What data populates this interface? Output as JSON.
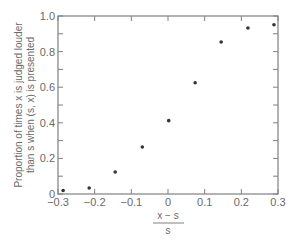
{
  "chart_data": {
    "type": "scatter",
    "title": "",
    "xlabel": {
      "numerator": "x − s",
      "denominator": "s"
    },
    "ylabel": [
      "Proportion of times x is judged louder",
      "than s when (s, x) is presented"
    ],
    "xlim": [
      -0.3,
      0.3
    ],
    "ylim": [
      0,
      1.0
    ],
    "x_ticks": [
      -0.3,
      -0.2,
      -0.1,
      0,
      0.1,
      0.2,
      0.3
    ],
    "x_tick_labels": [
      "−0.3",
      "−0.2",
      "−0.1",
      "0",
      "0.1",
      "0.2",
      "0.3"
    ],
    "y_ticks": [
      0,
      0.2,
      0.4,
      0.6,
      0.8,
      1.0
    ],
    "y_tick_labels": [
      "0",
      "0.2",
      "0.4",
      "0.6",
      "0.8",
      "1.0"
    ],
    "y_minor_ticks": [
      0.1,
      0.3,
      0.5,
      0.7,
      0.9
    ],
    "grid": false,
    "legend": null,
    "series": [
      {
        "name": "observed proportions",
        "x": [
          -0.286,
          -0.215,
          -0.144,
          -0.07,
          0.002,
          0.074,
          0.145,
          0.218,
          0.289
        ],
        "y": [
          0.02,
          0.034,
          0.124,
          0.264,
          0.412,
          0.625,
          0.854,
          0.933,
          0.951
        ]
      }
    ]
  },
  "style": {
    "axis_color": "#808080",
    "point_color": "#333333",
    "text_color": "#6a6a6a"
  }
}
